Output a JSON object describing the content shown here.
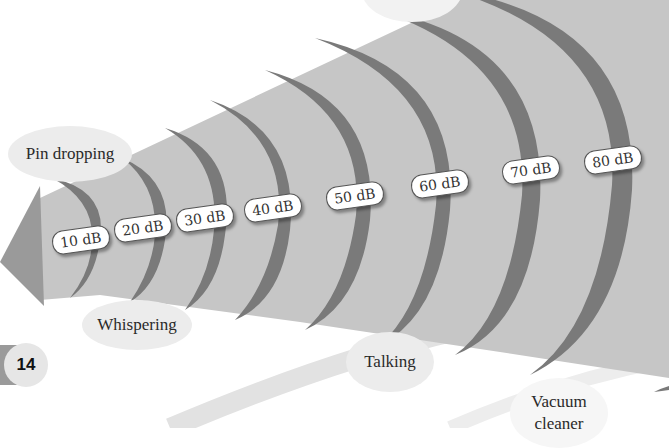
{
  "diagram": {
    "colors": {
      "cone": "#c4c4c4",
      "arc": "#777777",
      "arrow": "#9a9a9a",
      "bubble": "#ececec",
      "label_border": "#555555"
    },
    "levels": [
      {
        "label": "10 dB",
        "value": 10
      },
      {
        "label": "20 dB",
        "value": 20
      },
      {
        "label": "30 dB",
        "value": 30
      },
      {
        "label": "40 dB",
        "value": 40
      },
      {
        "label": "50 dB",
        "value": 50
      },
      {
        "label": "60 dB",
        "value": 60
      },
      {
        "label": "70 dB",
        "value": 70
      },
      {
        "label": "80 dB",
        "value": 80
      }
    ],
    "sources": [
      {
        "label": "Pin dropping",
        "level": "10 dB"
      },
      {
        "label": "Whispering",
        "level": "20-30 dB"
      },
      {
        "label": "Talking",
        "level": "60 dB"
      },
      {
        "label": "Vacuum cleaner",
        "level": "80 dB"
      }
    ]
  },
  "page": {
    "number": "14"
  }
}
